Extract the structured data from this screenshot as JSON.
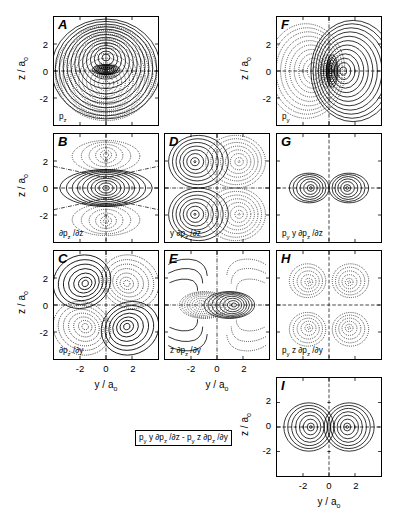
{
  "figure": {
    "axis_labels": {
      "x": "y / a",
      "x_sub": "o",
      "y": "z / a",
      "y_sub": "o"
    },
    "tick_values": [
      "-2",
      "0",
      "2"
    ],
    "axis_range": [
      -3.2,
      3.2
    ],
    "contour_style": {
      "positive": "solid",
      "negative": "dotted",
      "node": "dash-dot",
      "line_color": "#000000",
      "background": "#ffffff"
    }
  },
  "panels": [
    {
      "id": "A",
      "letter": "A",
      "function_html": "p<sub>z</sub>",
      "function_text": "p_z",
      "col": 0,
      "row": 0,
      "show_y_axis": true,
      "show_x_axis": false,
      "kind": "pz"
    },
    {
      "id": "B",
      "letter": "B",
      "function_html": "<span class=\"it\">∂</span>p<sub>z</sub> /<span class=\"it\">∂</span>z",
      "function_text": "∂p_z/∂z",
      "col": 0,
      "row": 1,
      "show_y_axis": true,
      "show_x_axis": false,
      "kind": "dpz_dz"
    },
    {
      "id": "C",
      "letter": "C",
      "function_html": "<span class=\"it\">∂</span>p<sub>z</sub> /<span class=\"it\">∂</span>y",
      "function_text": "∂p_z/∂y",
      "col": 0,
      "row": 2,
      "show_y_axis": true,
      "show_x_axis": true,
      "kind": "dpz_dy"
    },
    {
      "id": "D",
      "letter": "D",
      "function_html": "y <span class=\"it\">∂</span>p<sub>z</sub> /<span class=\"it\">∂</span>z",
      "function_text": "y ∂p_z/∂z",
      "col": 1,
      "row": 1,
      "show_y_axis": false,
      "show_x_axis": false,
      "kind": "y_dpz_dz"
    },
    {
      "id": "E",
      "letter": "E",
      "function_html": "z <span class=\"it\">∂</span>p<sub>z</sub> /<span class=\"it\">∂</span>y",
      "function_text": "z ∂p_z/∂y",
      "col": 1,
      "row": 2,
      "show_y_axis": false,
      "show_x_axis": true,
      "kind": "z_dpz_dy"
    },
    {
      "id": "F",
      "letter": "F",
      "function_html": "p<sub>y</sub>",
      "function_text": "p_y",
      "col": 2,
      "row": 0,
      "show_y_axis": true,
      "show_x_axis": false,
      "kind": "py"
    },
    {
      "id": "G",
      "letter": "G",
      "function_html": "p<sub>y</sub> y <span class=\"it\">∂</span>p<sub>z</sub> /<span class=\"it\">∂</span>z",
      "function_text": "p_y y ∂p_z/∂z",
      "col": 2,
      "row": 1,
      "show_y_axis": false,
      "show_x_axis": false,
      "kind": "g_prod"
    },
    {
      "id": "H",
      "letter": "H",
      "function_html": "p<sub>y</sub> z <span class=\"it\">∂</span>p<sub>z</sub> /<span class=\"it\">∂</span>y",
      "function_text": "p_y z ∂p_z/∂y",
      "col": 2,
      "row": 2,
      "show_y_axis": false,
      "show_x_axis": false,
      "kind": "h_prod"
    },
    {
      "id": "I",
      "letter": "I",
      "function_html": "p<sub>y</sub> y <span class=\"it\">∂</span>p<sub>z</sub> /<span class=\"it\">∂</span>z - p<sub>y</sub> z <span class=\"it\">∂</span>p<sub>z</sub> /<span class=\"it\">∂</span>y",
      "function_text": "p_y y ∂p_z/∂z - p_y z ∂p_z/∂y",
      "col": 2,
      "row": 3,
      "show_y_axis": true,
      "show_x_axis": true,
      "boxed_label": true,
      "kind": "i_diff"
    }
  ],
  "chart_data": {
    "type": "contour-grid",
    "title": "",
    "xlabel": "y / a_o",
    "ylabel": "z / a_o",
    "xlim": [
      -3.2,
      3.2
    ],
    "ylim": [
      -3.2,
      3.2
    ],
    "xticks": [
      -2,
      0,
      2
    ],
    "yticks": [
      -2,
      0,
      2
    ],
    "grid": false,
    "legend": "none",
    "panel_ids": [
      "A",
      "B",
      "C",
      "D",
      "E",
      "F",
      "G",
      "H",
      "I"
    ],
    "panel_functions": [
      "p_z",
      "∂p_z/∂z",
      "∂p_z/∂y",
      "y ∂p_z/∂z",
      "z ∂p_z/∂y",
      "p_y",
      "p_y y ∂p_z/∂z",
      "p_y z ∂p_z/∂y",
      "p_y y ∂p_z/∂z - p_y z ∂p_z/∂y"
    ]
  }
}
